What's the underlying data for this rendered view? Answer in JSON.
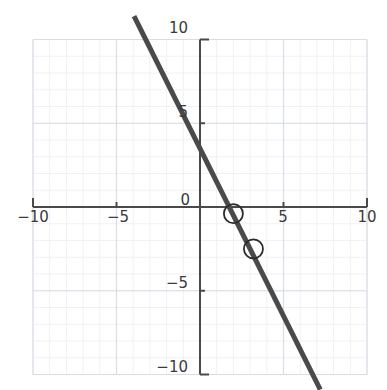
{
  "chart_data": {
    "type": "line",
    "title": "",
    "subtitle": "",
    "xlabel": "",
    "ylabel": "",
    "xlim": [
      -10,
      10
    ],
    "ylim": [
      -10,
      10
    ],
    "grid": true,
    "grid_major_step": 5,
    "grid_minor_step": 1,
    "legend": "none",
    "axis_style": "centered-cross",
    "x_ticks": [
      -10,
      -5,
      0,
      5,
      10
    ],
    "x_tick_labels": [
      "−10",
      "−5",
      "0",
      "5",
      "10"
    ],
    "y_ticks": [
      -10,
      -5,
      5,
      10
    ],
    "y_tick_labels": [
      "−10",
      "−5",
      "5",
      "10"
    ],
    "series": [
      {
        "name": "line",
        "type": "line",
        "equation": "y = -2x + 3.5",
        "slope": -2,
        "intercept": 3.5,
        "color": "#4a4a4a",
        "linewidth": 5,
        "x": [
          -3.95,
          7.2
        ],
        "y": [
          11.4,
          -10.9
        ],
        "x_intercept": 1.75
      },
      {
        "name": "marked-points",
        "type": "scatter",
        "marker": "open-circle",
        "color": "#2b2b2b",
        "points": [
          {
            "x": 2.0,
            "y": -0.4
          },
          {
            "x": 3.2,
            "y": -2.5
          }
        ]
      }
    ],
    "colors": {
      "line": "#4a4a4a",
      "axis": "#4a4a4a",
      "grid_major": "#d8dde4",
      "grid_minor": "#eef1f5",
      "tick_label": "#3a3a3a",
      "marker_stroke": "#2b2b2b",
      "background": "#ffffff"
    }
  },
  "labels": {
    "x_neg10": "−10",
    "x_neg5": "−5",
    "x_zero": "0",
    "x_pos5": "5",
    "x_pos10": "10",
    "y_pos10": "10",
    "y_pos5": "5",
    "y_neg5": "−5",
    "y_neg10": "−10"
  }
}
